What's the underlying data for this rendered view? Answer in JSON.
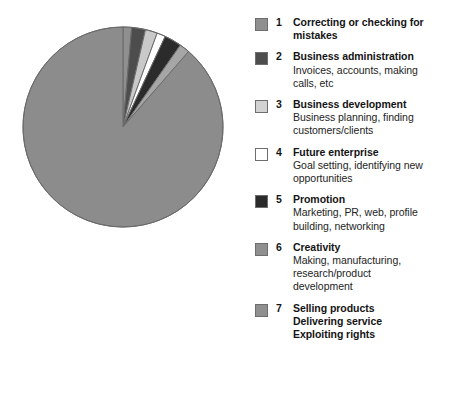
{
  "chart_data": {
    "type": "pie",
    "title": "",
    "subtitle": "",
    "legend_position": "right",
    "grid": false,
    "categories": [
      "Correcting or checking for mistakes",
      "Business administration",
      "Business development",
      "Future enterprise",
      "Promotion",
      "Creativity",
      "Selling products / Delivering service / Exploiting rights"
    ],
    "values": [
      5,
      8,
      7,
      5,
      10,
      6,
      319
    ],
    "units": "degrees",
    "percentages": [
      1.4,
      2.2,
      1.9,
      1.4,
      2.8,
      1.7,
      88.6
    ],
    "start_angle_deg": 0,
    "direction": "clockwise",
    "slice_colors": [
      "#8f8f8f",
      "#4d4d4d",
      "#c9c9c9",
      "#ffffff",
      "#2b2b2b",
      "#a6a6a6",
      "#8c8c8c"
    ]
  },
  "legend": {
    "items": [
      {
        "number": "1",
        "title": "Correcting or checking for mistakes",
        "title_lines": [
          "Correcting or checking for",
          "mistakes"
        ],
        "desc_lines": [],
        "swatch_color": "#8f8f8f"
      },
      {
        "number": "2",
        "title": "Business administration",
        "title_lines": [
          "Business administration"
        ],
        "desc_lines": [
          "Invoices, accounts, making",
          "calls, etc"
        ],
        "swatch_color": "#4d4d4d"
      },
      {
        "number": "3",
        "title": "Business development",
        "title_lines": [
          "Business development"
        ],
        "desc_lines": [
          "Business planning, finding",
          "customers/clients"
        ],
        "swatch_color": "#d2d2d2"
      },
      {
        "number": "4",
        "title": "Future enterprise",
        "title_lines": [
          "Future enterprise"
        ],
        "desc_lines": [
          "Goal setting, identifying new",
          "opportunities"
        ],
        "swatch_color": "#ffffff"
      },
      {
        "number": "5",
        "title": "Promotion",
        "title_lines": [
          "Promotion"
        ],
        "desc_lines": [
          "Marketing, PR, web, profile",
          "building, networking"
        ],
        "swatch_color": "#2b2b2b"
      },
      {
        "number": "6",
        "title": "Creativity",
        "title_lines": [
          "Creativity"
        ],
        "desc_lines": [
          "Making, manufacturing,",
          "research/product",
          "development"
        ],
        "swatch_color": "#8f8f8f"
      },
      {
        "number": "7",
        "title": "Selling products Delivering service Exploiting rights",
        "title_lines": [
          "Selling products",
          "Delivering service",
          "Exploiting rights"
        ],
        "desc_lines": [],
        "swatch_color": "#8f8f8f"
      }
    ]
  },
  "pie": {
    "center_x": 101,
    "center_y": 103,
    "radius": 100,
    "outline_color": "#6b6b6b"
  }
}
